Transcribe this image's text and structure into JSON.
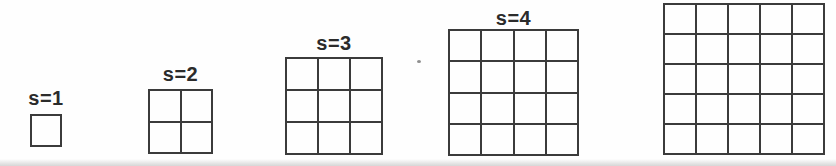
{
  "figure": {
    "grids": [
      {
        "label": "s=1",
        "s": 1
      },
      {
        "label": "s=2",
        "s": 2
      },
      {
        "label": "s=3",
        "s": 3
      },
      {
        "label": "s=4",
        "s": 4
      },
      {
        "label": "",
        "s": 5
      }
    ],
    "colors": {
      "background": "#fefefe",
      "line": "#3b3b3b",
      "label": "#2b2b2b",
      "speck": "#8f8f8f"
    }
  }
}
